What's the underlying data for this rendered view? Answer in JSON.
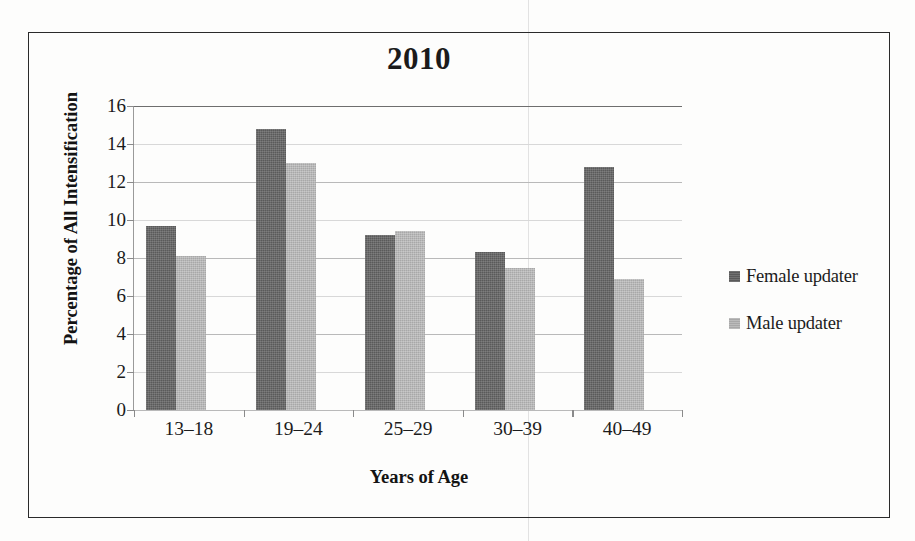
{
  "figure": {
    "title": "2010",
    "legend_position": "right"
  },
  "chart_data": {
    "type": "bar",
    "title": "2010",
    "xlabel": "Years of Age",
    "ylabel": "Percentage of All Intensification",
    "categories": [
      "13–18",
      "19–24",
      "25–29",
      "30–39",
      "40–49"
    ],
    "series": [
      {
        "name": "Female updater",
        "color": "#5a5a5a",
        "values": [
          9.7,
          14.8,
          9.2,
          8.3,
          12.8
        ]
      },
      {
        "name": "Male updater",
        "color": "#a8a8a8",
        "values": [
          8.1,
          13.0,
          9.4,
          7.5,
          6.9
        ]
      }
    ],
    "ylim": [
      0,
      16
    ],
    "ytick_step": 2,
    "yticks": [
      16,
      14,
      12,
      10,
      8,
      6,
      4,
      2,
      0
    ],
    "grid": true,
    "grid_axis": "y",
    "legend": [
      "Female updater",
      "Male updater"
    ],
    "legend_position": "right"
  }
}
